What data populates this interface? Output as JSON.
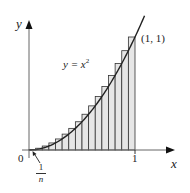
{
  "chart_data": {
    "type": "area",
    "title": "",
    "function": "y = x^2",
    "n_rectangles": 16,
    "rectangle_type": "right-endpoint upper sum",
    "x": [
      0.0625,
      0.125,
      0.1875,
      0.25,
      0.3125,
      0.375,
      0.4375,
      0.5,
      0.5625,
      0.625,
      0.6875,
      0.75,
      0.8125,
      0.875,
      0.9375,
      1.0
    ],
    "values": [
      0.0039,
      0.0156,
      0.0352,
      0.0625,
      0.0977,
      0.1406,
      0.1914,
      0.25,
      0.3164,
      0.3906,
      0.4727,
      0.5625,
      0.6602,
      0.7656,
      0.8789,
      1.0
    ],
    "xlabel": "x",
    "ylabel": "y",
    "xlim": [
      0,
      1.3
    ],
    "ylim": [
      0,
      1.2
    ],
    "grid": false,
    "annotations": [
      "y = x²",
      "(1, 1)",
      "1/n",
      "0",
      "1"
    ]
  },
  "labels": {
    "y_axis": "y",
    "x_axis": "x",
    "origin": "0",
    "x_tick_one": "1",
    "curve_label_lhs": "y = x",
    "curve_label_exp": "2",
    "point_label": "(1, 1)",
    "width_numerator": "1",
    "width_denominator": "n"
  },
  "colors": {
    "axis": "#555555",
    "curve": "#222222",
    "rect_fill": "#e6e6e6",
    "rect_stroke": "#333333"
  }
}
